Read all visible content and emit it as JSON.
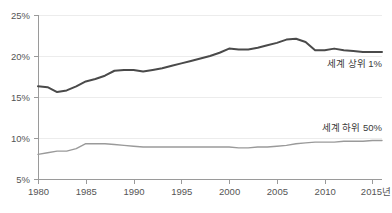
{
  "chart_data": {
    "type": "line",
    "title": "",
    "subtitle": "",
    "xlabel": "",
    "ylabel": "",
    "xlim": [
      1980,
      2016
    ],
    "ylim": [
      5,
      25
    ],
    "grid": true,
    "legend_position": "inline-right",
    "x_tick_labels": [
      "1980",
      "1985",
      "1990",
      "1995",
      "2000",
      "2005",
      "2010",
      "2015년"
    ],
    "x_tick_values": [
      1980,
      1985,
      1990,
      1995,
      2000,
      2005,
      2010,
      2015
    ],
    "y_tick_labels": [
      "25%",
      "20%",
      "15%",
      "10%",
      "5%"
    ],
    "y_tick_values": [
      25,
      20,
      15,
      10,
      5
    ],
    "x": [
      1980,
      1981,
      1982,
      1983,
      1984,
      1985,
      1986,
      1987,
      1988,
      1989,
      1990,
      1991,
      1992,
      1993,
      1994,
      1995,
      1996,
      1997,
      1998,
      1999,
      2000,
      2001,
      2002,
      2003,
      2004,
      2005,
      2006,
      2007,
      2008,
      2009,
      2010,
      2011,
      2012,
      2013,
      2014,
      2015,
      2016
    ],
    "series": [
      {
        "name": "세계 상위 1%",
        "color": "#4a4a4a",
        "stroke_width": 2.0,
        "label_x": 2016,
        "label_y": 18.6,
        "values": [
          16.3,
          16.2,
          15.6,
          15.8,
          16.3,
          16.9,
          17.2,
          17.6,
          18.2,
          18.3,
          18.3,
          18.1,
          18.3,
          18.5,
          18.8,
          19.1,
          19.4,
          19.7,
          20.0,
          20.4,
          20.9,
          20.8,
          20.8,
          21.0,
          21.3,
          21.6,
          22.0,
          22.1,
          21.7,
          20.7,
          20.7,
          20.9,
          20.7,
          20.6,
          20.5,
          20.5,
          20.5
        ]
      },
      {
        "name": "세계 하위 50%",
        "color": "#9a9a9a",
        "stroke_width": 1.4,
        "label_x": 2016,
        "label_y": 10.9,
        "values": [
          8.0,
          8.2,
          8.4,
          8.4,
          8.7,
          9.3,
          9.3,
          9.3,
          9.2,
          9.1,
          9.0,
          8.9,
          8.9,
          8.9,
          8.9,
          8.9,
          8.9,
          8.9,
          8.9,
          8.9,
          8.9,
          8.8,
          8.8,
          8.9,
          8.9,
          9.0,
          9.1,
          9.3,
          9.4,
          9.5,
          9.5,
          9.5,
          9.6,
          9.6,
          9.6,
          9.7,
          9.7
        ]
      }
    ]
  },
  "colors": {
    "background": "#ffffff",
    "gridline": "#ececec",
    "axis": "#9a9a9a",
    "text": "#555555",
    "series_top": "#4a4a4a",
    "series_bottom": "#9a9a9a"
  }
}
